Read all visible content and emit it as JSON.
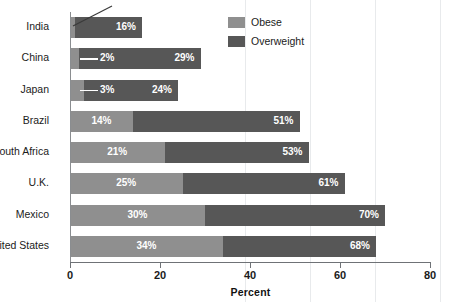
{
  "chart_data": {
    "type": "bar",
    "orientation": "horizontal",
    "overlap_mode": "nested",
    "title": "",
    "subtitle": "",
    "xlabel": "Percent",
    "ylabel": "",
    "xlim": [
      0,
      80
    ],
    "xticks": [
      0,
      20,
      40,
      60,
      80
    ],
    "xtick_labels": [
      "0",
      "20",
      "40",
      "60",
      "80"
    ],
    "grid": false,
    "legend_position": "top-right",
    "categories": [
      "India",
      "China",
      "Japan",
      "Brazil",
      "South Africa",
      "U.K.",
      "Mexico",
      "United States"
    ],
    "series": [
      {
        "name": "Obese",
        "color": "#8f8f8f",
        "values": [
          1,
          2,
          3,
          14,
          21,
          25,
          30,
          34
        ],
        "value_labels": [
          "1%",
          "2%",
          "3%",
          "14%",
          "21%",
          "25%",
          "30%",
          "34%"
        ]
      },
      {
        "name": "Overweight",
        "color": "#575757",
        "values": [
          16,
          29,
          24,
          51,
          53,
          61,
          70,
          68
        ],
        "value_labels": [
          "16%",
          "29%",
          "24%",
          "51%",
          "53%",
          "61%",
          "70%",
          "68%"
        ]
      }
    ],
    "annotations": [
      {
        "text": "1%",
        "target_category": "India",
        "target_series": "Obese",
        "style": "diagonal-leader-line"
      },
      {
        "text": "2%",
        "target_category": "China",
        "target_series": "Obese",
        "style": "horizontal-leader-line"
      },
      {
        "text": "3%",
        "target_category": "Japan",
        "target_series": "Obese",
        "style": "horizontal-leader-line"
      }
    ]
  },
  "legend": {
    "items": [
      {
        "label": "Obese",
        "color": "#8f8f8f"
      },
      {
        "label": "Overweight",
        "color": "#575757"
      }
    ]
  },
  "axis": {
    "x_title": "Percent",
    "ticks": [
      "0",
      "20",
      "40",
      "60",
      "80"
    ]
  }
}
